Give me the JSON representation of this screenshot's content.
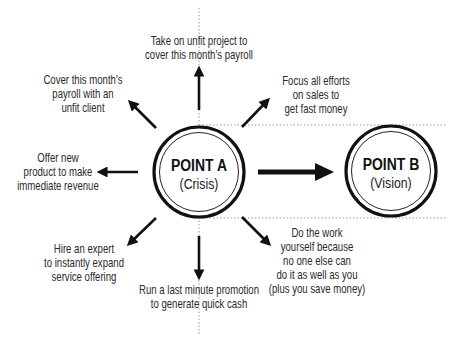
{
  "diagram": {
    "point_a": {
      "title": "POINT A",
      "subtitle": "(Crisis)"
    },
    "point_b": {
      "title": "POINT B",
      "subtitle": "(Vision)"
    },
    "options": {
      "top": [
        "Take on unfit project to",
        "cover this month's payroll"
      ],
      "top_left": [
        "Cover this month's",
        "payroll with an",
        "unfit client"
      ],
      "top_right": [
        "Focus all efforts",
        "on sales to",
        "get fast money"
      ],
      "left": [
        "Offer new",
        "product to make",
        "immediate revenue"
      ],
      "bottom_left": [
        "Hire an expert",
        "to instantly expand",
        "service offering"
      ],
      "bottom": [
        "Run a last minute promotion",
        "to generate quick cash"
      ],
      "bottom_right": [
        "Do the work",
        "yourself because",
        "no one else can",
        "do it as well as you",
        "(plus you save money)"
      ]
    },
    "colors": {
      "ink": "#111111",
      "text": "#2a2a2a",
      "guide": "#9a9a9a",
      "background": "#ffffff"
    }
  }
}
